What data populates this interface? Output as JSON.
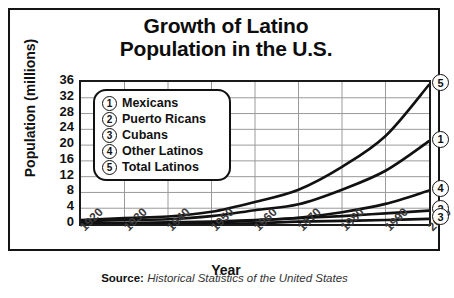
{
  "chart_data": {
    "type": "line",
    "title": "Growth of Latino Population in the U.S.",
    "title_line1": "Growth of Latino",
    "title_line2": "Population in the U.S.",
    "xlabel": "Year",
    "ylabel": "Population (millions)",
    "x": [
      1920,
      1930,
      1940,
      1950,
      1960,
      1970,
      1980,
      1990,
      2000
    ],
    "xtick_labels": [
      "1920",
      "1930",
      "1940",
      "1950",
      "1960",
      "1970",
      "1980",
      "1990",
      "2000"
    ],
    "ytick_labels": [
      "36",
      "32",
      "28",
      "24",
      "20",
      "16",
      "12",
      "8",
      "4",
      "0"
    ],
    "ytick_values": [
      36,
      32,
      28,
      24,
      20,
      16,
      12,
      8,
      4,
      0
    ],
    "ylim": [
      0,
      36
    ],
    "xlim": [
      1920,
      2000
    ],
    "grid": true,
    "legend_position": "upper-left-inset",
    "series": [
      {
        "key": "1",
        "name": "Mexicans",
        "values": [
          0.7,
          1.0,
          1.2,
          2.0,
          3.5,
          5.0,
          8.7,
          13.5,
          21.0
        ]
      },
      {
        "key": "2",
        "name": "Puerto Ricans",
        "values": [
          0.1,
          0.15,
          0.2,
          0.4,
          0.9,
          1.5,
          2.0,
          2.7,
          3.4
        ]
      },
      {
        "key": "3",
        "name": "Cubans",
        "values": [
          0.03,
          0.05,
          0.06,
          0.1,
          0.2,
          0.6,
          0.8,
          1.0,
          1.3
        ]
      },
      {
        "key": "4",
        "name": "Other Latinos",
        "values": [
          0.2,
          0.3,
          0.4,
          0.6,
          1.0,
          1.6,
          3.0,
          5.1,
          8.5
        ]
      },
      {
        "key": "5",
        "name": "Total Latinos",
        "values": [
          1.0,
          1.5,
          1.9,
          3.1,
          5.6,
          8.7,
          14.5,
          22.3,
          35.3
        ]
      }
    ]
  },
  "legend": {
    "items": [
      {
        "num": "1",
        "label": "Mexicans"
      },
      {
        "num": "2",
        "label": "Puerto Ricans"
      },
      {
        "num": "3",
        "label": "Cubans"
      },
      {
        "num": "4",
        "label": "Other Latinos"
      },
      {
        "num": "5",
        "label": "Total Latinos"
      }
    ]
  },
  "end_labels": [
    {
      "num": "5",
      "value": 35.3
    },
    {
      "num": "1",
      "value": 21.0
    },
    {
      "num": "4",
      "value": 8.5
    },
    {
      "num": "2",
      "value": 3.4
    },
    {
      "num": "3",
      "value": 1.3
    }
  ],
  "source": {
    "prefix": "Source:",
    "text": "Historical Statistics of the United States"
  },
  "colors": {
    "line": "#111111",
    "grid": "#9a9a9a",
    "axis": "#1a1a1a",
    "text": "#111111"
  }
}
